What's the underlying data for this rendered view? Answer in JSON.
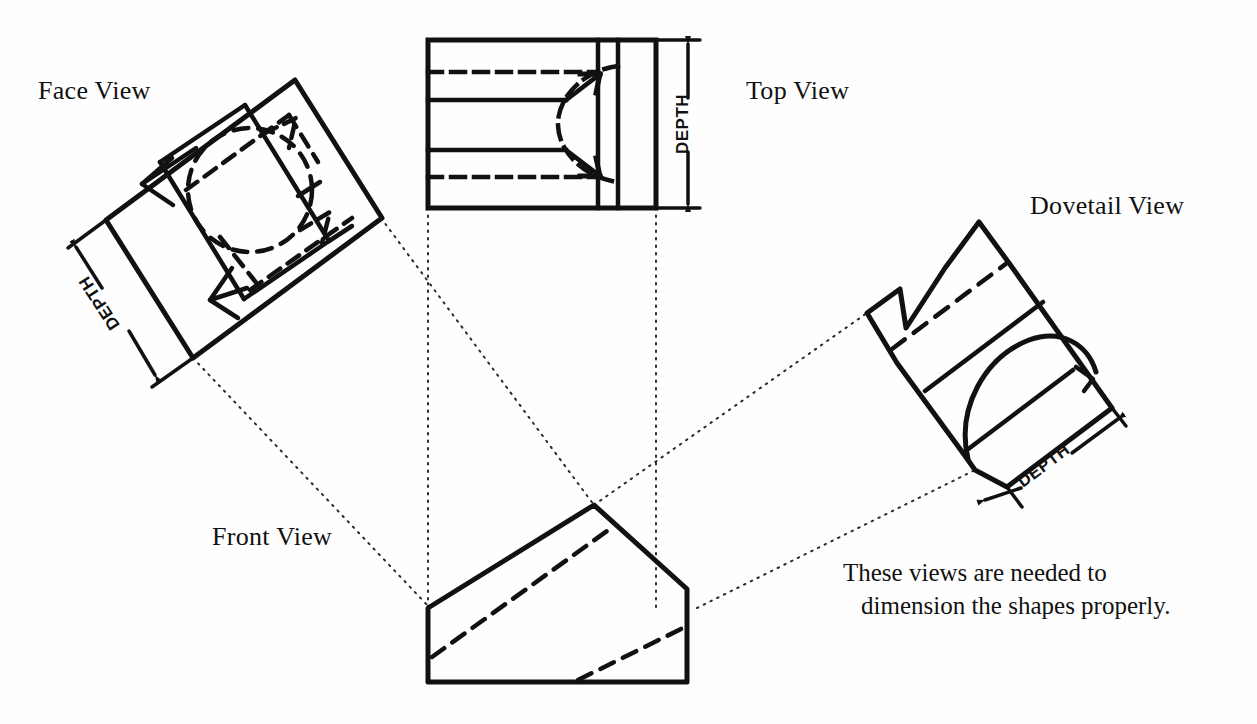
{
  "page": {
    "width": 1257,
    "height": 724,
    "background_color": "#fefefe",
    "ink_color": "#111111"
  },
  "labels": {
    "face_view": "Face View",
    "top_view": "Top View",
    "dovetail_view": "Dovetail View",
    "front_view": "Front View"
  },
  "dimensions": {
    "face_depth": "DEPTH",
    "top_depth": "DEPTH",
    "dovetail_depth": "DEPTH"
  },
  "caption": {
    "line1": "These views are needed to",
    "line2": "dimension the shapes properly."
  },
  "line_styles": {
    "visible_edge": "solid",
    "hidden_edge": "dashed",
    "projection_line": "dotted"
  }
}
